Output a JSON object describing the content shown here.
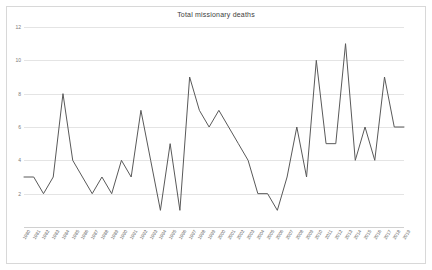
{
  "chart_data": {
    "type": "line",
    "title": "Total missionary deaths",
    "xlabel": "",
    "ylabel": "",
    "ylim": [
      0,
      12
    ],
    "yticks": [
      2,
      4,
      6,
      8,
      10,
      12
    ],
    "grid": true,
    "legend": "none",
    "line_color": "#595959",
    "background_color": "#ffffff",
    "grid_color": "#e4e4e4",
    "border_color": "#d8d8d8",
    "title_color": "#3c3c3c",
    "tick_color": "#7a7a7a",
    "categories": [
      "1980",
      "1981",
      "1982",
      "1983",
      "1984",
      "1985",
      "1986",
      "1987",
      "1988",
      "1989",
      "1990",
      "1991",
      "1992",
      "1993",
      "1994",
      "1995",
      "1996",
      "1997",
      "1998",
      "1999",
      "2000",
      "2001",
      "2002",
      "2003",
      "2004",
      "2005",
      "2006",
      "2007",
      "2008",
      "2009",
      "2010",
      "2011",
      "2012",
      "2013",
      "2014",
      "2015",
      "2016",
      "2017",
      "2018",
      "2019"
    ],
    "values": [
      3,
      3,
      2,
      3,
      8,
      4,
      3,
      2,
      3,
      2,
      4,
      3,
      7,
      4,
      1,
      5,
      1,
      9,
      7,
      6,
      7,
      6,
      5,
      4,
      2,
      2,
      1,
      3,
      6,
      3,
      10,
      5,
      5,
      11,
      4,
      6,
      4,
      9,
      6,
      6
    ],
    "series_name": "Total missionary deaths"
  }
}
